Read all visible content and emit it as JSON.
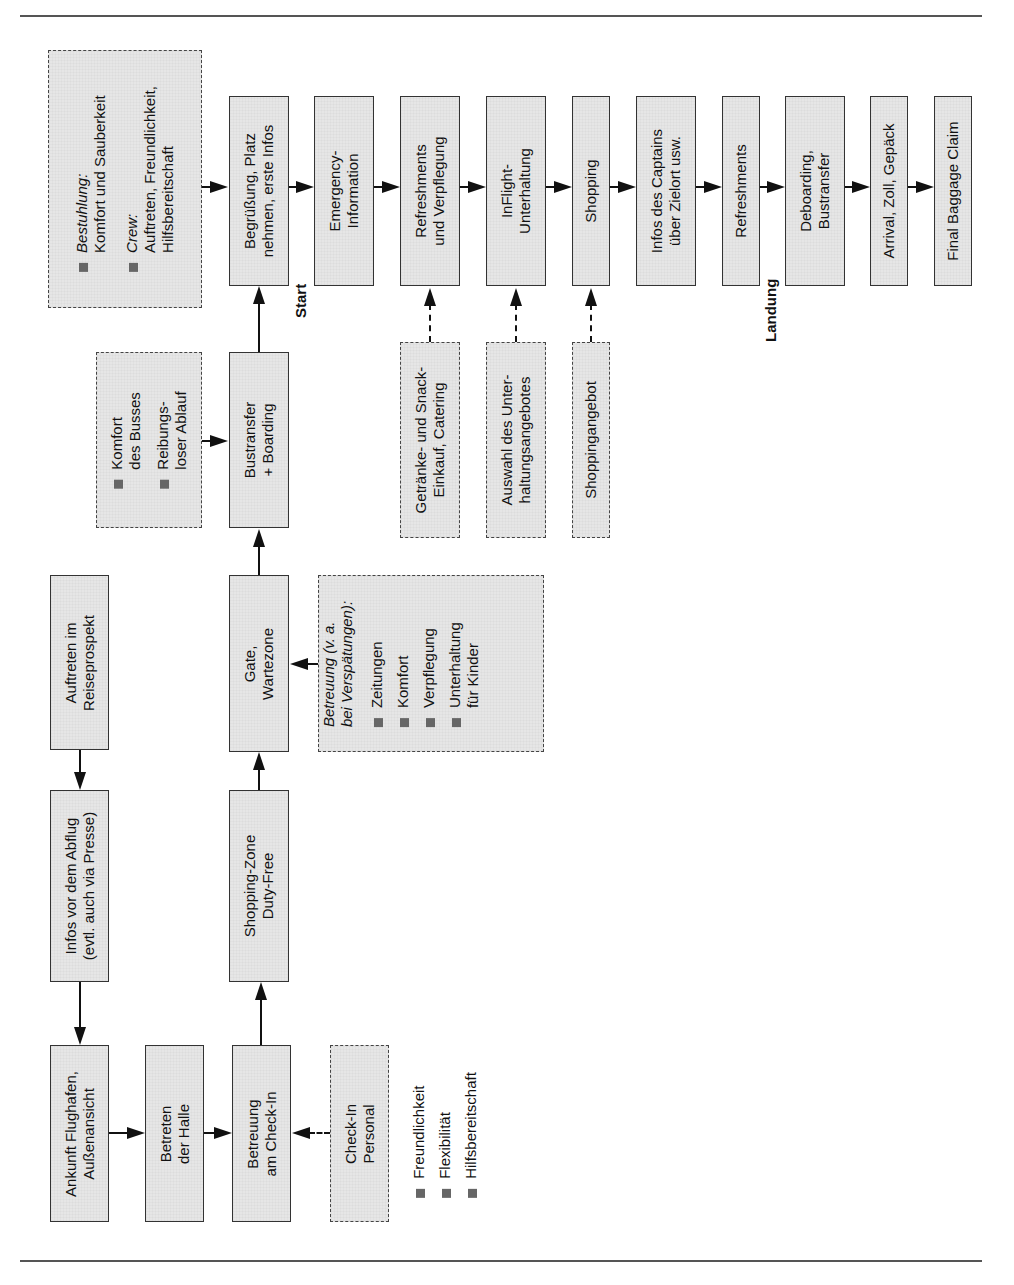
{
  "flow_top": [
    {
      "id": "begruessung",
      "text": "Begrüßung, Platz\nnehmen, erste Infos"
    },
    {
      "id": "emergency",
      "text": "Emergency-\nInformation"
    },
    {
      "id": "refreshments-verpflegung",
      "text": "Refreshments\nund Verpflegung"
    },
    {
      "id": "inflight",
      "text": "InFlight-\nUnterhaltung"
    },
    {
      "id": "shopping",
      "text": "Shopping"
    },
    {
      "id": "infos-captain",
      "text": "Infos des Captains\nüber Zielort usw."
    },
    {
      "id": "refreshments",
      "text": "Refreshments"
    },
    {
      "id": "deboarding",
      "text": "Deboarding,\nBustransfer"
    },
    {
      "id": "arrival",
      "text": "Arrival, Zoll, Gepäck"
    },
    {
      "id": "baggage",
      "text": "Final Baggage Claim"
    }
  ],
  "bestuhlung_box": {
    "item1_title": "Bestuhlung:",
    "item1_text": "Komfort und Sauberkeit",
    "item2_title": "Crew:",
    "item2_line1": "Auftreten, Freundlichkeit,",
    "item2_line2": "Hilfsbereitschaft"
  },
  "bus_box": {
    "item1_line1": "Komfort",
    "item1_line2": "des Busses",
    "item2_line1": "Reibungs-",
    "item2_line2": "loser Ablauf"
  },
  "bustransfer": "Bustransfer\n+ Boarding",
  "supply_boxes": [
    {
      "id": "getraenke",
      "text": "Getränke- und Snack-\nEinkauf, Catering"
    },
    {
      "id": "auswahl",
      "text": "Auswahl des Unter-\nhaltungsangebotes"
    },
    {
      "id": "shoppingangebot",
      "text": "Shoppingangebot"
    }
  ],
  "gate": "Gate,\nWartezone",
  "betreuung_box": {
    "title_line1": "Betreuung (v. a.",
    "title_line2": "bei Verspätungen):",
    "items": [
      "Zeitungen",
      "Komfort",
      "Verpflegung",
      "Unterhaltung"
    ],
    "item4_line2": "für Kinder"
  },
  "auftreten": "Auftreten im\nReiseprospekt",
  "infos_vor": "Infos vor dem Abflug\n(evtl. auch via Presse)",
  "shopping_zone": "Shopping-Zone\nDuty-Free",
  "flow_bottom": [
    {
      "id": "ankunft",
      "text": "Ankunft Flughafen,\nAußenansicht"
    },
    {
      "id": "betreten",
      "text": "Betreten\nder Halle"
    },
    {
      "id": "betreuung-checkin",
      "text": "Betreuung\nam Check-In"
    }
  ],
  "checkin_personal": "Check-In\nPersonal",
  "checkin_attributes": [
    "Freundlichkeit",
    "Flexibilität",
    "Hilfsbereitschaft"
  ],
  "labels": {
    "start": "Start",
    "landung": "Landung"
  }
}
